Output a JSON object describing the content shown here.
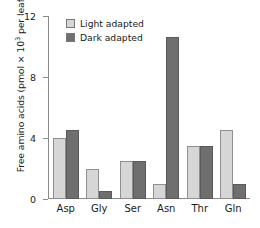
{
  "chart_data": {
    "type": "bar",
    "title": "",
    "xlabel": "",
    "ylabel": "Free amino acids (pmol × 10³ per leaf)",
    "ylabel_prefix": "Free amino acids (pmol × 10",
    "ylabel_exponent": "3",
    "ylabel_suffix": " per leaf)",
    "categories": [
      "Asp",
      "Gly",
      "Ser",
      "Asn",
      "Thr",
      "Gln"
    ],
    "series": [
      {
        "name": "Light adapted",
        "color": "#d6d6d6",
        "values": [
          4.0,
          2.0,
          2.5,
          1.0,
          3.5,
          4.5
        ]
      },
      {
        "name": "Dark adapted",
        "color": "#6f6f6f",
        "values": [
          4.5,
          0.5,
          2.5,
          10.6,
          3.5,
          1.0
        ]
      }
    ],
    "ylim": [
      0,
      12
    ],
    "yticks": [
      0,
      4,
      8,
      12
    ],
    "ytick_labels": [
      "0",
      "4",
      "8",
      "12"
    ],
    "grid": false,
    "legend_position": "top-left"
  }
}
